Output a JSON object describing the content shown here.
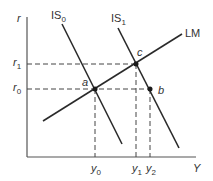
{
  "diagram": {
    "axes": {
      "y_label": "r",
      "x_label": "Y"
    },
    "curves": {
      "is0": {
        "label": "IS",
        "sub": "0"
      },
      "is1": {
        "label": "IS",
        "sub": "1"
      },
      "lm": {
        "label": "LM"
      }
    },
    "points": {
      "a": "a",
      "b": "b",
      "c": "c"
    },
    "y_ticks": {
      "r1": {
        "label": "r",
        "sub": "1"
      },
      "r0": {
        "label": "r",
        "sub": "0"
      }
    },
    "x_ticks": {
      "y0": {
        "label": "y",
        "sub": "0"
      },
      "y1": {
        "label": "y",
        "sub": "1"
      },
      "y2": {
        "label": "y",
        "sub": "2"
      }
    },
    "colors": {
      "line": "#2a2a2a",
      "axis": "#555555",
      "dash": "#444444"
    }
  }
}
